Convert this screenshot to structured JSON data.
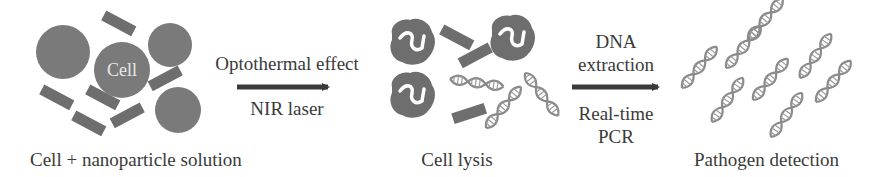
{
  "diagram": {
    "type": "process-flow",
    "stages": [
      {
        "id": "stage-1",
        "label": "Cell + nanoparticle solution",
        "cell_label": "Cell"
      },
      {
        "id": "stage-2",
        "label": "Cell lysis"
      },
      {
        "id": "stage-3",
        "label": "Pathogen detection"
      }
    ],
    "transitions": [
      {
        "from": "stage-1",
        "to": "stage-2",
        "above": "Optothermal effect",
        "below": "NIR laser"
      },
      {
        "from": "stage-2",
        "to": "stage-3",
        "above_line1": "DNA",
        "above_line2": "extraction",
        "below_line1": "Real-time",
        "below_line2": "PCR"
      }
    ],
    "colors": {
      "cell_fill": "#7a7a7a",
      "rod_fill": "#6e6e6e",
      "dna_stroke": "#8a8a8a",
      "arrow": "#3a3a3a",
      "text": "#3a3a3a",
      "cell_text": "#e8e8e8"
    }
  }
}
